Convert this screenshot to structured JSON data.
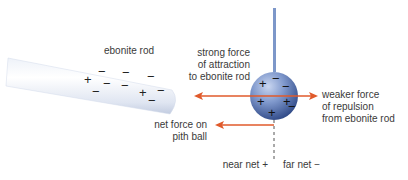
{
  "diagram": {
    "colors": {
      "arrow": "#e05a2b",
      "rod_light": "#f4f7fc",
      "rod_shade": "#c9d3e6",
      "ball_dark": "#2f4b8a",
      "ball_light": "#a9bde4",
      "string": "#7d97c9",
      "text": "#3a3a3a"
    },
    "rod": {
      "label": "ebonite rod",
      "charges": [
        "+",
        "−",
        "−",
        "−",
        "−",
        "−",
        "−",
        "+",
        "−",
        "−"
      ]
    },
    "pith_ball": {
      "charges_near": [
        "+",
        "+",
        "+"
      ],
      "charges_far": [
        "−",
        "−",
        "−",
        "−"
      ]
    },
    "labels": {
      "attraction": [
        "strong force",
        "of attraction",
        "to ebonite rod"
      ],
      "repulsion": [
        "weaker force",
        "of repulsion",
        "from ebonite rod"
      ],
      "net_force": [
        "net force on",
        "pith ball"
      ],
      "near_side": "near net +",
      "far_side": "far net −"
    }
  }
}
